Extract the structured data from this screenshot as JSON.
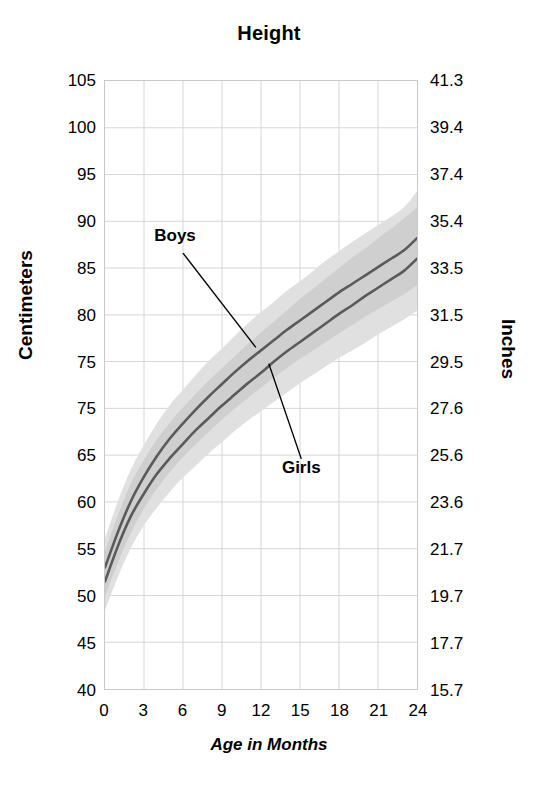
{
  "chart_data": {
    "type": "line",
    "title": "Height",
    "xlabel": "Age in Months",
    "ylabel": "Centimeters",
    "ylabel_right": "Inches",
    "xlim": [
      0,
      24
    ],
    "ylim": [
      40,
      105
    ],
    "grid": true,
    "legend_position": "inline-annotation",
    "x_ticks": [
      "0",
      "3",
      "6",
      "9",
      "12",
      "15",
      "18",
      "21",
      "24"
    ],
    "x_tick_values": [
      0,
      3,
      6,
      9,
      12,
      15,
      18,
      21,
      24
    ],
    "y_ticks_left": [
      "105",
      "100",
      "95",
      "90",
      "85",
      "80",
      "75",
      "75",
      "65",
      "60",
      "55",
      "50",
      "45",
      "40"
    ],
    "y_tick_values_left": [
      105,
      100,
      95,
      90,
      85,
      80,
      75,
      70,
      65,
      60,
      55,
      50,
      45,
      40
    ],
    "y_ticks_right": [
      "41.3",
      "39.4",
      "37.4",
      "35.4",
      "33.5",
      "31.5",
      "29.5",
      "27.6",
      "25.6",
      "23.6",
      "21.7",
      "19.7",
      "17.7",
      "15.7"
    ],
    "y_tick_values_right": [
      41.3,
      39.4,
      37.4,
      35.4,
      33.5,
      31.5,
      29.5,
      27.6,
      25.6,
      23.6,
      21.7,
      19.7,
      17.7,
      15.7
    ],
    "x": [
      0,
      1,
      2,
      3,
      4,
      5,
      6,
      7,
      8,
      9,
      10,
      11,
      12,
      13,
      14,
      15,
      16,
      17,
      18,
      19,
      20,
      21,
      22,
      23,
      24
    ],
    "series": [
      {
        "name": "Boys",
        "color": "#5a5a5a",
        "values": [
          53.0,
          56.8,
          60.1,
          62.7,
          64.9,
          66.8,
          68.4,
          69.9,
          71.3,
          72.6,
          73.9,
          75.1,
          76.2,
          77.3,
          78.4,
          79.4,
          80.4,
          81.4,
          82.4,
          83.3,
          84.2,
          85.1,
          86.0,
          86.9,
          88.2
        ],
        "band_lower": [
          49.9,
          53.5,
          56.7,
          59.3,
          61.4,
          63.2,
          64.8,
          66.2,
          67.5,
          68.8,
          70.0,
          71.1,
          72.2,
          73.3,
          74.3,
          75.3,
          76.2,
          77.1,
          78.0,
          78.9,
          79.8,
          80.6,
          81.4,
          82.2,
          83.2
        ],
        "band_upper": [
          56.1,
          60.1,
          63.5,
          66.1,
          68.4,
          70.4,
          72.0,
          73.6,
          75.1,
          76.4,
          77.8,
          79.1,
          80.3,
          81.4,
          82.6,
          83.6,
          84.7,
          85.8,
          86.8,
          87.8,
          88.7,
          89.6,
          90.5,
          91.5,
          93.2
        ]
      },
      {
        "name": "Girls",
        "color": "#5a5a5a",
        "values": [
          51.5,
          55.3,
          58.5,
          60.9,
          63.0,
          64.7,
          66.2,
          67.7,
          69.0,
          70.3,
          71.5,
          72.7,
          73.8,
          75.0,
          76.1,
          77.1,
          78.1,
          79.1,
          80.1,
          81.0,
          82.0,
          82.9,
          83.8,
          84.7,
          86.0
        ],
        "band_lower": [
          48.4,
          52.0,
          55.1,
          57.5,
          59.4,
          61.1,
          62.6,
          63.9,
          65.2,
          66.4,
          67.6,
          68.7,
          69.7,
          70.7,
          71.7,
          72.7,
          73.6,
          74.5,
          75.4,
          76.2,
          77.0,
          77.9,
          78.7,
          79.5,
          80.4
        ],
        "band_upper": [
          54.7,
          58.6,
          62.0,
          64.5,
          66.7,
          68.5,
          70.1,
          71.6,
          73.0,
          74.3,
          75.6,
          76.9,
          78.1,
          79.3,
          80.5,
          81.7,
          82.8,
          83.9,
          85.0,
          86.1,
          87.1,
          88.2,
          89.2,
          90.3,
          91.5
        ]
      }
    ],
    "annotations": [
      {
        "label": "Boys",
        "points_to_series": "Boys"
      },
      {
        "label": "Girls",
        "points_to_series": "Girls"
      }
    ]
  },
  "colors": {
    "curve": "#5a5a5a",
    "band_outer": "#e0e0e0",
    "band_inner": "#cfcfcf",
    "grid": "#d6d6d6",
    "frame": "#c9c9c9",
    "text": "#000000"
  }
}
